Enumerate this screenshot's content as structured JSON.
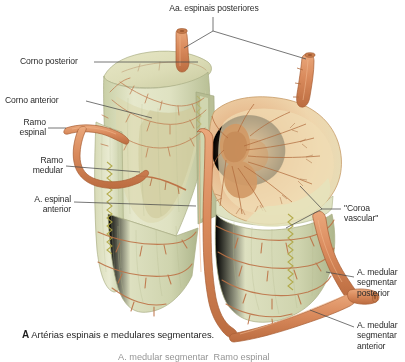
{
  "figure": {
    "title_marker": "A",
    "caption": "Artérias espinais e medulares segmentares.",
    "clipped_next_line": "A. medular segmentar  Ramo espinal",
    "background": "#ffffff"
  },
  "palette": {
    "vessel": "#d98a5c",
    "vessel_dark": "#b5653a",
    "vessel_light": "#e9a87e",
    "cord_pale": "#e3e5c7",
    "cord_green": "#cfd4ae",
    "cord_shadow": "#b9c096",
    "gray_matter": "#d9a271",
    "cut_face": "#e8c79a",
    "cut_face_light": "#f1ddb8",
    "rootlet": "#b9b04e",
    "leader": "#555555",
    "text": "#2b2b2b"
  },
  "labels": [
    {
      "id": "aa-espinais-posteriores",
      "text": "Aa. espinais posteriores",
      "x": 152,
      "y": 5,
      "align": "left"
    },
    {
      "id": "corno-posterior",
      "text": "Corno posterior",
      "x": 20,
      "y": 58,
      "align": "left"
    },
    {
      "id": "corno-anterior",
      "text": "Corno anterior",
      "x": 6,
      "y": 96,
      "align": "left"
    },
    {
      "id": "ramo-espinal",
      "text": "Ramo\nespinal",
      "x": 14,
      "y": 120,
      "align": "right"
    },
    {
      "id": "ramo-medular",
      "text": "Ramo\nmedular",
      "x": 32,
      "y": 158,
      "align": "right"
    },
    {
      "id": "a-espinal-anterior",
      "text": "A. espinal\nanterior",
      "x": 24,
      "y": 196,
      "align": "right"
    },
    {
      "id": "coroa-vascular",
      "text": "\"Coroa\nvascular\"",
      "x": 345,
      "y": 203,
      "align": "left"
    },
    {
      "id": "a-medular-segmentar-posterior",
      "text": "A. medular\nsegmentar\nposterior",
      "x": 358,
      "y": 268,
      "align": "left"
    },
    {
      "id": "a-medular-segmentar-anterior",
      "text": "A. medular\nsegmentar\nanterior",
      "x": 358,
      "y": 322,
      "align": "left"
    }
  ],
  "structures": [
    {
      "id": "spinal-cord-block",
      "name": "spinal cord segment, cut open"
    },
    {
      "id": "cross-section-face",
      "name": "transverse cut surface showing gray matter"
    },
    {
      "id": "posterior-spinal-artery-stump-left",
      "name": "posterior spinal artery stump"
    },
    {
      "id": "posterior-spinal-artery-stump-right",
      "name": "posterior spinal artery stump"
    },
    {
      "id": "anterior-spinal-artery",
      "name": "anterior spinal artery running vertically"
    },
    {
      "id": "segmental-medullary-artery-loop",
      "name": "segmental medullary artery loop"
    },
    {
      "id": "vasocorona",
      "name": "vasocorona radiating vessels"
    },
    {
      "id": "denticulate-rootlets",
      "name": "rootlet zigzag along cut margin"
    }
  ]
}
